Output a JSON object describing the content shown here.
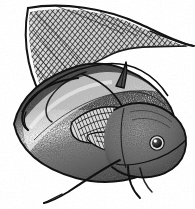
{
  "image": {
    "title": "Catfish engraving illustration",
    "subject": "catfish",
    "style": "stipple engraving / scratchboard line art",
    "medium": "black ink on white",
    "width_px": 195,
    "height_px": 209,
    "background_color": "#ffffff",
    "ink_color": "#1a1a1a",
    "midtone_color": "#6e6e6e",
    "highlight_color": "#f2f2f2",
    "orientation": "head lower-right, tail upper-left",
    "has_border": false,
    "has_text": false,
    "color_mode": "grayscale"
  },
  "parts": [
    {
      "id": "caudal-fin",
      "label": "Caudal fin (deeply forked tail)",
      "shading": "dense cross-hatch",
      "tone": "dark"
    },
    {
      "id": "caudal-filament",
      "label": "Upper caudal filament",
      "shading": "thin tapered line",
      "tone": "dark"
    },
    {
      "id": "caudal-lower-lobe",
      "label": "Lower caudal lobe",
      "shading": "cross-hatch",
      "tone": "dark"
    },
    {
      "id": "body",
      "label": "Body / flank",
      "shading": "stipple",
      "tone": "mid"
    },
    {
      "id": "flank-highlight",
      "label": "Lateral highlight band",
      "shading": "blank paper",
      "tone": "light"
    },
    {
      "id": "dorsal-spine",
      "label": "Dorsal fin spine",
      "shading": "outline",
      "tone": "dark"
    },
    {
      "id": "pectoral-fin",
      "label": "Pectoral fin with rays",
      "shading": "striated rays",
      "tone": "mid"
    },
    {
      "id": "pelvic-fin",
      "label": "Pelvic fin",
      "shading": "striated rays",
      "tone": "mid"
    },
    {
      "id": "head",
      "label": "Head",
      "shading": "fine stipple",
      "tone": "mid"
    },
    {
      "id": "eye",
      "label": "Eye",
      "shading": "solid pupil with catchlight",
      "tone": "dark"
    },
    {
      "id": "maxillary-barbel",
      "label": "Maxillary barbel",
      "shading": "line",
      "tone": "dark"
    },
    {
      "id": "mandibular-barbel",
      "label": "Mandibular barbels",
      "shading": "line",
      "tone": "dark"
    },
    {
      "id": "nasal-barbel",
      "label": "Nasal barbel",
      "shading": "line",
      "tone": "dark"
    }
  ]
}
